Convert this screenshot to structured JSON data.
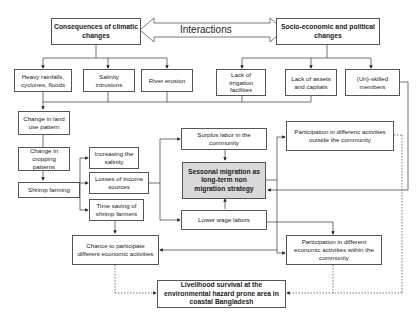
{
  "diagram": {
    "interaction_label": "Interactions",
    "top_left": "Consequences of climatic changes",
    "top_right": "Socio-economic and political changes",
    "climate_effects": [
      "Heavy rainfalls, cyclones, floods",
      "Salinity intrusions",
      "River erosion"
    ],
    "socio_effects": [
      "Lack of irrigation facilities",
      "Lack of assets and capitals",
      "(Un)-skilled members"
    ],
    "left_chain": [
      "Change in land use pattern",
      "Change in cropping patterns",
      "Shrimp farming"
    ],
    "shrimp_outcomes": [
      "Increasing the salinity",
      "Losses of income sources",
      "Time saving of shrimp farmers"
    ],
    "center": {
      "surplus": "Surplus labor in the community",
      "core": "Sessonal migration as long-term non migration strategy",
      "lower_wage": "Lower wage labors"
    },
    "right": {
      "outside": "Participation in differenc activities outside the community",
      "within": "Participation in different economic activities within the community"
    },
    "chance": "Chance to participate different economic activities",
    "final": "Livelihood survival at the environmental hazard prone area in coastal Bangladesh"
  }
}
